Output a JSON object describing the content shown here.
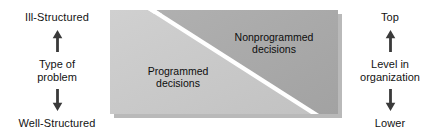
{
  "diagram": {
    "left_axis": {
      "top_label": "Ill-Structured",
      "middle_label_line1": "Type of",
      "middle_label_line2": "problem",
      "bottom_label": "Well-Structured",
      "up_arrow_icon": "arrow-up-icon",
      "down_arrow_icon": "arrow-down-icon"
    },
    "right_axis": {
      "top_label": "Top",
      "middle_label_line1": "Level in",
      "middle_label_line2": "organization",
      "bottom_label": "Lower",
      "up_arrow_icon": "arrow-up-icon",
      "down_arrow_icon": "arrow-down-icon"
    },
    "zones": [
      {
        "id": "programmed",
        "line1": "Programmed",
        "line2": "decisions",
        "fill_color": "#c9c9c9"
      },
      {
        "id": "nonprogrammed",
        "line1": "Nonprogrammed",
        "line2": "decisions",
        "fill_color": "#a9a9a9"
      }
    ],
    "divider": {
      "id": "diagonal-divider",
      "color": "#ffffff"
    },
    "colors": {
      "background": "#ffffff",
      "text": "#131313",
      "arrow": "#3a3a3a",
      "shadow": "#b9b9b9",
      "light_zone": "#c9c9c9",
      "dark_zone": "#a9a9a9"
    }
  }
}
